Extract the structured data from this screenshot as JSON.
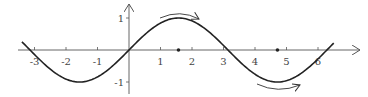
{
  "chart_data": {
    "type": "line",
    "title": "",
    "function": "y = sin(x)",
    "xlabel": "",
    "ylabel": "",
    "xlim": [
      -3.4,
      6.9
    ],
    "ylim": [
      -1.4,
      1.4
    ],
    "x_ticks": [
      -3,
      -2,
      -1,
      1,
      2,
      3,
      4,
      5,
      6
    ],
    "x_tick_labels": [
      "-3",
      "-2",
      "-1",
      "1",
      "2",
      "3",
      "4",
      "5",
      "6"
    ],
    "y_ticks": [
      1,
      -1
    ],
    "y_tick_labels": [
      "1",
      "-1"
    ],
    "grid": false,
    "legend": null,
    "series": [
      {
        "name": "sin(x)",
        "x": [
          -3.4,
          -3.14,
          -2.36,
          -1.57,
          -0.79,
          0,
          0.79,
          1.57,
          2.36,
          3.14,
          3.93,
          4.71,
          5.5,
          6.28,
          6.5
        ],
        "values": [
          0.26,
          0.0,
          -0.71,
          -1.0,
          -0.71,
          0.0,
          0.71,
          1.0,
          0.71,
          0.0,
          -0.71,
          -1.0,
          -0.71,
          0.0,
          0.22
        ]
      }
    ],
    "marked_points": [
      {
        "x": 1.5708,
        "y": 0,
        "label": "π/2"
      },
      {
        "x": 4.7124,
        "y": 0,
        "label": "3π/2"
      }
    ],
    "annotations": [
      {
        "type": "curved-arrow",
        "position": "above maximum",
        "direction": "right"
      },
      {
        "type": "curved-arrow",
        "position": "below minimum",
        "direction": "right"
      }
    ]
  },
  "colors": {
    "curve": "#222222",
    "axis": "#555555",
    "text": "#444444",
    "background": "#ffffff"
  }
}
